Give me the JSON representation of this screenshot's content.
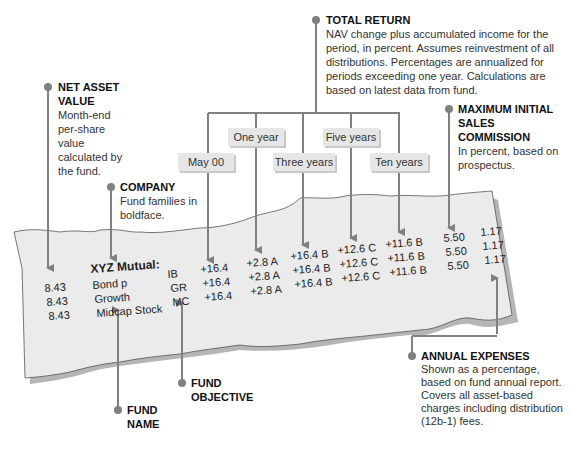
{
  "callouts": {
    "total_return": {
      "title": "TOTAL RETURN",
      "body": "NAV change plus accumulated income for the period, in percent. Assumes reinvestment of all distributions. Percentages are annualized for periods exceeding one year. Calculations are based on latest data from fund."
    },
    "net_asset_value": {
      "title": "NET ASSET VALUE",
      "body": "Month-end per-share value calculated by the fund."
    },
    "company": {
      "title": "COMPANY",
      "body": "Fund families in boldface."
    },
    "max_sales_commission": {
      "title": "MAXIMUM INITIAL SALES COMMISSION",
      "body": "In percent, based on prospectus."
    },
    "annual_expenses": {
      "title": "ANNUAL EXPENSES",
      "body": "Shown as a percentage, based on fund annual report. Covers all asset-based charges including distribution (12b-1) fees."
    },
    "fund_name": {
      "title": "FUND NAME"
    },
    "fund_objective": {
      "title": "FUND OBJECTIVE"
    }
  },
  "column_headers": {
    "may00": "May 00",
    "one_year": "One year",
    "three_years": "Three years",
    "five_years": "Five years",
    "ten_years": "Ten years"
  },
  "listing": {
    "company": "XYZ Mutual:",
    "rows": [
      {
        "nav": "8.43",
        "name": "Bond p",
        "objective": "IB",
        "may00": "+16.4",
        "one_year": "+2.8 A",
        "three_years": "+16.4 B",
        "five_years": "+12.6 C",
        "ten_years": "+11.6 B",
        "max_sales": "5.50",
        "expenses": "1.17"
      },
      {
        "nav": "8.43",
        "name": "Growth",
        "objective": "GR",
        "may00": "+16.4",
        "one_year": "+2.8 A",
        "three_years": "+16.4 B",
        "five_years": "+12.6 C",
        "ten_years": "+11.6 B",
        "max_sales": "5.50",
        "expenses": "1.17"
      },
      {
        "nav": "8.43",
        "name": "Midcap Stock",
        "objective": "MC",
        "may00": "+16.4",
        "one_year": "+2.8 A",
        "three_years": "+16.4 B",
        "five_years": "+12.6 C",
        "ten_years": "+11.6 B",
        "max_sales": "5.50",
        "expenses": "1.17"
      }
    ]
  },
  "colors": {
    "line": "#808080",
    "paper": "#ebebeb",
    "paper_shadow": "#b5b5b5",
    "header_box": "#e6e6e6"
  }
}
